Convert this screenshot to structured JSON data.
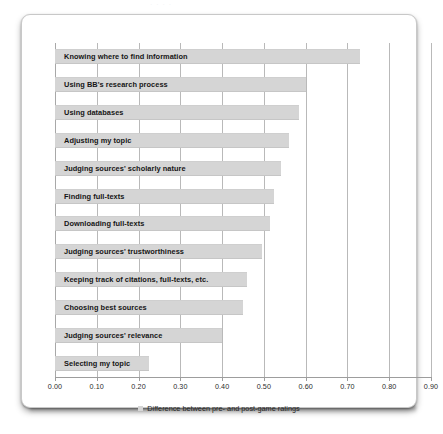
{
  "ghost_text": "· ·  ·   ·",
  "chart_data": {
    "type": "bar",
    "orientation": "horizontal",
    "title": "",
    "xlabel": "",
    "ylabel": "",
    "xlim": [
      0.0,
      0.9
    ],
    "grid": true,
    "legend_position": "bottom",
    "categories": [
      "Knowing where to find information",
      "Using BB's research process",
      "Using databases",
      "Adjusting my topic",
      "Judging sources' scholarly nature",
      "Finding full-texts",
      "Downloading full-texts",
      "Judging sources' trustworthiness",
      "Keeping track of citations, full-texts, etc.",
      "Choosing best sources",
      "Judging sources' relevance",
      "Selecting my topic"
    ],
    "values": [
      0.73,
      0.6,
      0.585,
      0.56,
      0.54,
      0.525,
      0.515,
      0.495,
      0.46,
      0.45,
      0.4,
      0.225
    ],
    "series": [
      {
        "name": "Difference between pre- and post-game ratings",
        "values": [
          0.73,
          0.6,
          0.585,
          0.56,
          0.54,
          0.525,
          0.515,
          0.495,
          0.46,
          0.45,
          0.4,
          0.225
        ],
        "color": "#d5d5d5"
      }
    ],
    "tick_labels": [
      "0.00",
      "0.10",
      "0.20",
      "0.30",
      "0.40",
      "0.50",
      "0.60",
      "0.70",
      "0.80",
      "0.90"
    ],
    "tick_values": [
      0.0,
      0.1,
      0.2,
      0.3,
      0.4,
      0.5,
      0.6,
      0.7,
      0.8,
      0.9
    ]
  },
  "legend": {
    "label": "Difference between pre- and post-game ratings",
    "swatch_color": "#d5d5d5"
  }
}
